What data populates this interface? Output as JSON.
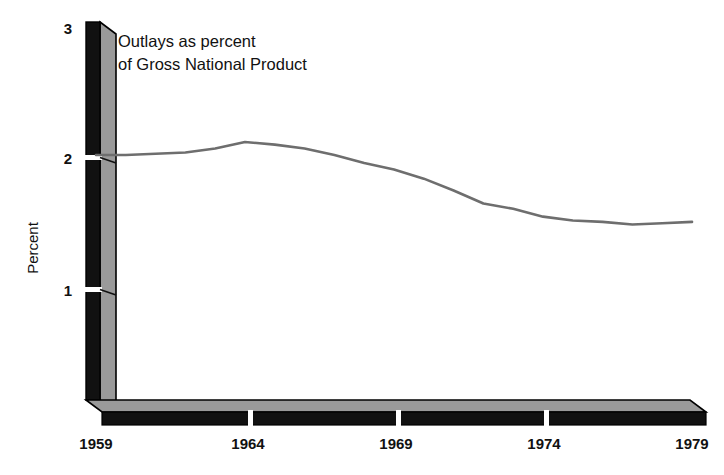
{
  "chart_data": {
    "type": "line",
    "title": "Outlays as percent of Gross National Product",
    "title_line1": "Outlays as percent",
    "title_line2": "of Gross National Product",
    "xlabel": "",
    "ylabel": "Percent",
    "xlim": [
      1959,
      1979
    ],
    "ylim": [
      0,
      3
    ],
    "grid": false,
    "legend": "none",
    "x_ticks": [
      "1959",
      "1964",
      "1969",
      "1974",
      "1979"
    ],
    "x_tick_values": [
      1959,
      1964,
      1969,
      1974,
      1979
    ],
    "y_ticks": [
      "1",
      "2",
      "3"
    ],
    "y_tick_values": [
      1,
      2,
      3
    ],
    "line_color": "#6e6e6e",
    "axis_color": "#000000",
    "axis_face_color": "#9a9a9a",
    "x": [
      1959,
      1960,
      1961,
      1962,
      1963,
      1964,
      1965,
      1966,
      1967,
      1968,
      1969,
      1970,
      1971,
      1972,
      1973,
      1974,
      1975,
      1976,
      1977,
      1978,
      1979
    ],
    "values": [
      2.03,
      2.03,
      2.04,
      2.05,
      2.08,
      2.13,
      2.11,
      2.08,
      2.03,
      1.97,
      1.92,
      1.85,
      1.76,
      1.66,
      1.62,
      1.56,
      1.53,
      1.52,
      1.5,
      1.51,
      1.52
    ],
    "series": [
      {
        "name": "Outlays as percent of Gross National Product",
        "values": [
          2.03,
          2.03,
          2.04,
          2.05,
          2.08,
          2.13,
          2.11,
          2.08,
          2.03,
          1.97,
          1.92,
          1.85,
          1.76,
          1.66,
          1.62,
          1.56,
          1.53,
          1.52,
          1.5,
          1.51,
          1.52
        ]
      }
    ]
  }
}
